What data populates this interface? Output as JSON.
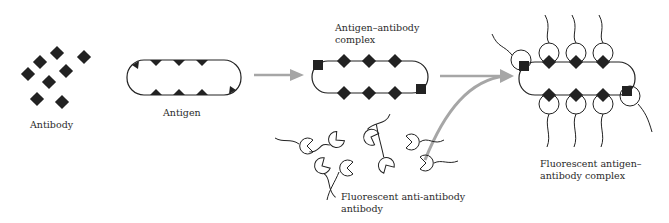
{
  "diagram": {
    "type": "process-flow",
    "stages": [
      {
        "id": "antibody",
        "label": "Antibody"
      },
      {
        "id": "antigen",
        "label": "Antigen"
      },
      {
        "id": "complex",
        "label_line1": "Antigen–antibody",
        "label_line2": "complex"
      },
      {
        "id": "anti_antibody",
        "label_line1": "Fluorescent anti-antibody",
        "label_line2": "antibody"
      },
      {
        "id": "fluorescent_complex",
        "label_line1": "Fluorescent antigen–",
        "label_line2": "antibody complex"
      }
    ],
    "arrows": [
      {
        "from": "antigen",
        "to": "complex",
        "color": "#a6a6a6"
      },
      {
        "from": "anti_antibody",
        "to": "fluorescent_complex",
        "color": "#a6a6a6"
      }
    ],
    "colors": {
      "ink": "#222222",
      "arrow": "#a6a6a6",
      "background": "#ffffff"
    }
  }
}
